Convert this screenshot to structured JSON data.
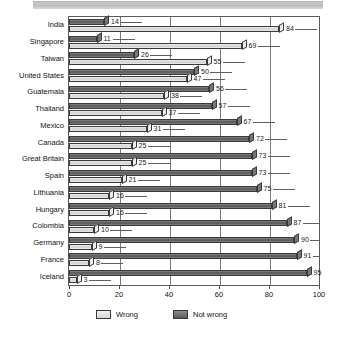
{
  "chart_data": {
    "type": "bar",
    "orientation": "horizontal",
    "title": "",
    "subtitle": "",
    "xlabel": "",
    "ylabel": "",
    "xlim": [
      0,
      100
    ],
    "xticks": [
      0,
      20,
      40,
      60,
      80,
      100
    ],
    "grid": true,
    "grid_axis": "x",
    "legend_position": "bottom-left",
    "categories": [
      "India",
      "Singapore",
      "Taiwan",
      "United States",
      "Guatemala",
      "Thailand",
      "Mexico",
      "Canada",
      "Great Britain",
      "Spain",
      "Lithuania",
      "Hungary",
      "Colombia",
      "Germany",
      "France",
      "Iceland"
    ],
    "series": [
      {
        "name": "Not wrong",
        "color": "#5c5c5c",
        "values": [
          14,
          11,
          26,
          50,
          56,
          57,
          67,
          72,
          73,
          73,
          75,
          81,
          87,
          90,
          91,
          95
        ]
      },
      {
        "name": "Wrong",
        "color": "#d9d9d9",
        "values": [
          84,
          69,
          55,
          47,
          38,
          37,
          31,
          25,
          25,
          21,
          16,
          16,
          10,
          9,
          8,
          3
        ]
      }
    ]
  },
  "legend": {
    "items": [
      {
        "label": "Wrong",
        "swatch": "wrong"
      },
      {
        "label": "Not wrong",
        "swatch": "notwrong"
      }
    ]
  }
}
